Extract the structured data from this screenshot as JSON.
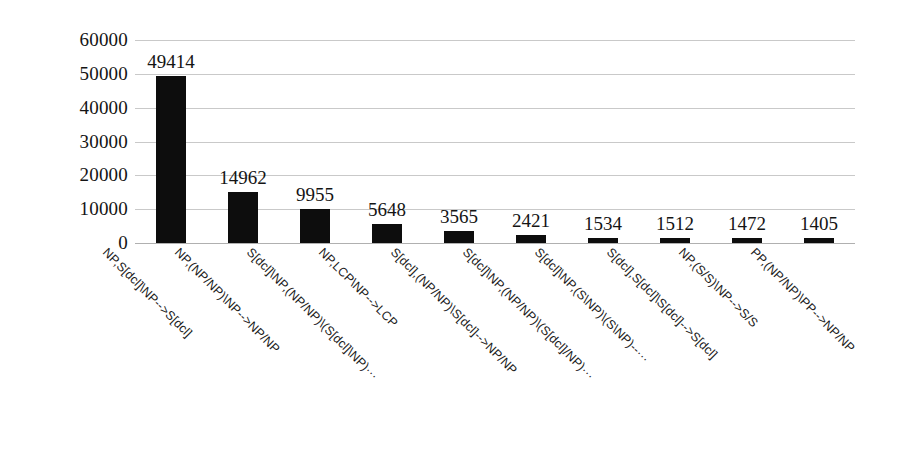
{
  "chart_data": {
    "type": "bar",
    "title": "",
    "subtitle": "",
    "xlabel": "",
    "ylabel": "",
    "ylim": [
      0,
      60000
    ],
    "grid": true,
    "legend": false,
    "legend_position": "none",
    "orientation": "vertical",
    "bar_color": "#0d0d0d",
    "gridline_color": "#c9c9c9",
    "y_ticks": [
      0,
      10000,
      20000,
      30000,
      40000,
      50000,
      60000
    ],
    "y_tick_labels": [
      "0",
      "10000",
      "20000",
      "30000",
      "40000",
      "50000",
      "60000"
    ],
    "categories": [
      "NP,S[dcl]\\NP-->S[dcl]",
      "NP,(NP/NP)\\NP-->NP/NP",
      "S[dcl]\\NP,(NP/NP)\\(S[dcl]\\NP)···",
      "NP,LCP\\NP-->LCP",
      "S[dcl],(NP/NP)\\S[dcl]-->NP/NP",
      "S[dcl]\\NP,(NP/NP)\\(S[dcl]/NP)···",
      "S[dcl]\\NP,(S\\NP)\\(S\\NP)--···",
      "S[dcl],S[dcl]\\S[dcl]-->S[dcl]",
      "NP,(S/S)\\NP-->S/S",
      "PP,(NP/NP)\\PP-->NP/NP"
    ],
    "values": [
      49414,
      14962,
      9955,
      5648,
      3565,
      2421,
      1534,
      1512,
      1472,
      1405
    ],
    "value_labels": [
      "49414",
      "14962",
      "9955",
      "5648",
      "3565",
      "2421",
      "1534",
      "1512",
      "1472",
      "1405"
    ]
  }
}
